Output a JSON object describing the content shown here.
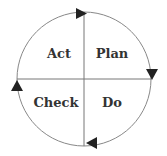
{
  "diagram": {
    "colors": {
      "line": "#777777",
      "arrow": "#222222",
      "text": "#333333",
      "background": "#ffffff"
    },
    "quadrants": [
      {
        "id": "act",
        "label": "Act",
        "position": "top-left"
      },
      {
        "id": "plan",
        "label": "Plan",
        "position": "top-right"
      },
      {
        "id": "check",
        "label": "Check",
        "position": "bottom-left"
      },
      {
        "id": "do",
        "label": "Do",
        "position": "bottom-right"
      }
    ],
    "arrows": [
      {
        "position": "top",
        "direction": "right"
      },
      {
        "position": "right",
        "direction": "down"
      },
      {
        "position": "bottom",
        "direction": "left"
      },
      {
        "position": "left",
        "direction": "up"
      }
    ],
    "flow": [
      "Plan",
      "Do",
      "Check",
      "Act"
    ]
  }
}
